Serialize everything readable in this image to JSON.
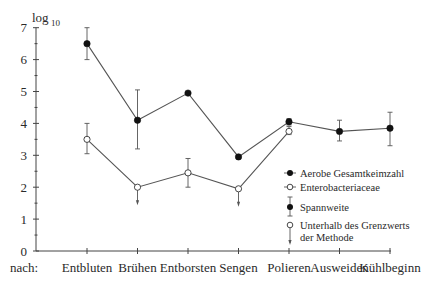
{
  "chart_data": {
    "type": "line",
    "title": "",
    "ylabel_unit": "log10",
    "ylabel_base": "log",
    "ylabel_sub": "10",
    "xlabel_prefix": "nach:",
    "categories": [
      "Entbluten",
      "Brühen",
      "Entborsten",
      "Sengen",
      "Polieren",
      "Ausweiden",
      "Kühlbeginn"
    ],
    "yticks": [
      0,
      1,
      2,
      3,
      4,
      5,
      6,
      7
    ],
    "ylim": [
      0,
      7
    ],
    "grid": false,
    "legend_position": "right-middle",
    "series": [
      {
        "name": "Aerobe Gesamtkeimzahl",
        "marker": "filled-circle",
        "values": [
          6.5,
          4.1,
          4.95,
          2.95,
          4.05,
          3.75,
          3.85
        ],
        "range_low": [
          6.0,
          3.2,
          null,
          null,
          3.95,
          3.45,
          3.3
        ],
        "range_high": [
          7.0,
          5.05,
          null,
          null,
          4.15,
          4.1,
          4.35
        ]
      },
      {
        "name": "Enterobacteriaceae",
        "marker": "open-circle",
        "values": [
          3.5,
          2.0,
          2.45,
          1.95,
          3.75,
          null,
          null
        ],
        "range_low": [
          3.05,
          null,
          2.0,
          null,
          3.65,
          null,
          null
        ],
        "range_high": [
          4.0,
          null,
          2.9,
          null,
          3.9,
          null,
          null
        ],
        "below_detection_limit": [
          false,
          true,
          false,
          true,
          false,
          false,
          false
        ]
      }
    ],
    "legend": [
      {
        "key": "filled-circle",
        "label": "Aerobe Gesamtkeimzahl"
      },
      {
        "key": "open-circle",
        "label": "Enterobacteriaceae"
      },
      {
        "key": "range-bar",
        "label": "Spannweite"
      },
      {
        "key": "below-limit-arrow",
        "label_line1": "Unterhalb des Grenzwerts",
        "label_line2": "der Methode"
      }
    ]
  }
}
